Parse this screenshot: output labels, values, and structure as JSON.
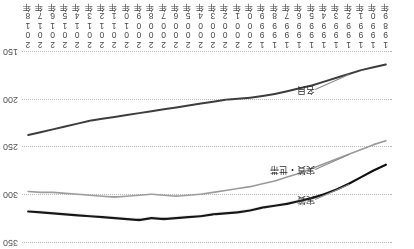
{
  "chart_data": {
    "type": "line",
    "title": "",
    "xlabel": "",
    "ylabel": "",
    "ylim": [
      150,
      350
    ],
    "yticks": [
      150,
      200,
      250,
      300,
      350
    ],
    "ytick_labels": [
      "150",
      "200",
      "250",
      "300",
      "350"
    ],
    "grid": true,
    "legend_position": "inline-left",
    "orientation_note": "figure rendered rotated 180 degrees",
    "x": [
      "1989年",
      "1990年",
      "1991年",
      "1992年",
      "1993年",
      "1994年",
      "1995年",
      "1996年",
      "1997年",
      "1998年",
      "1999年",
      "2000年",
      "2001年",
      "2002年",
      "2003年",
      "2004年",
      "2005年",
      "2006年",
      "2007年",
      "2008年",
      "2009年",
      "2010年",
      "2011年",
      "2012年",
      "2013年",
      "2014年",
      "2015年",
      "2016年",
      "2017年",
      "2018年"
    ],
    "series": [
      {
        "name": "名目",
        "color": "#3d3d3d",
        "values": [
          163,
          166,
          169,
          173,
          177,
          181,
          185,
          188,
          191,
          194,
          196,
          198,
          199,
          200,
          202,
          204,
          206,
          208,
          210,
          212,
          214,
          216,
          218,
          220,
          222,
          225,
          228,
          231,
          234,
          237
        ]
      },
      {
        "name": "実質・世帯",
        "color": "#9a9a9a",
        "values": [
          243,
          247,
          252,
          257,
          262,
          267,
          272,
          277,
          281,
          285,
          288,
          291,
          293,
          295,
          297,
          299,
          300,
          301,
          300,
          299,
          300,
          301,
          302,
          301,
          300,
          299,
          298,
          297,
          297,
          296
        ]
      },
      {
        "name": "実質",
        "color": "#111111",
        "values": [
          268,
          274,
          281,
          288,
          294,
          299,
          303,
          306,
          309,
          311,
          313,
          316,
          318,
          319,
          320,
          322,
          323,
          324,
          325,
          324,
          326,
          325,
          324,
          323,
          322,
          321,
          320,
          319,
          318,
          317
        ]
      }
    ]
  },
  "labels": {
    "series_nominal": "名目",
    "series_real_household": "実質・世帯",
    "series_real": "実質"
  }
}
